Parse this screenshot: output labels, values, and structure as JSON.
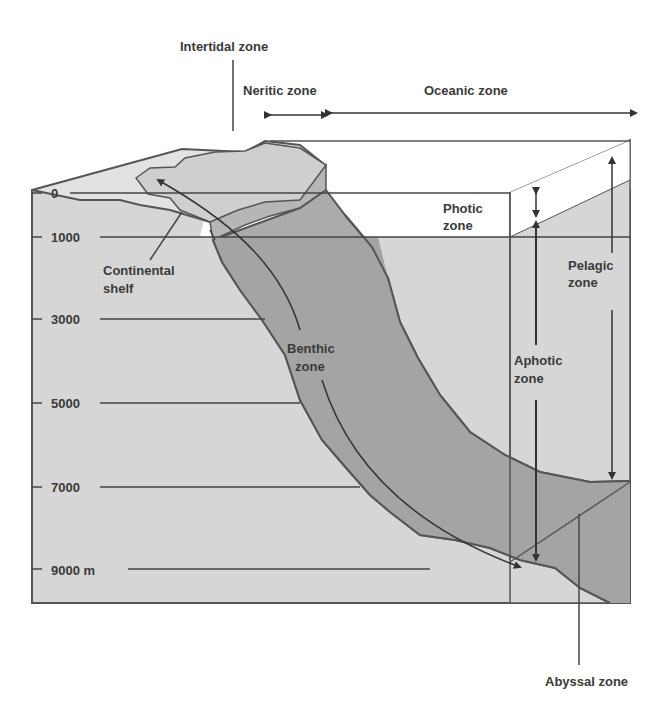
{
  "labels": {
    "intertidal": "Intertidal zone",
    "neritic": "Neritic zone",
    "oceanic": "Oceanic zone",
    "photic_1": "Photic",
    "photic_2": "zone",
    "pelagic_1": "Pelagic",
    "pelagic_2": "zone",
    "aphotic_1": "Aphotic",
    "aphotic_2": "zone",
    "continental_1": "Continental",
    "continental_2": "shelf",
    "benthic_1": "Benthic",
    "benthic_2": "zone",
    "abyssal": "Abyssal zone"
  },
  "depth_scale": {
    "ticks": [
      "0",
      "1000",
      "3000",
      "5000",
      "7000",
      "9000 m"
    ]
  },
  "colors": {
    "water_light": "#d6d6d6",
    "water_photic": "#ffffff",
    "slope_dark": "#a9a9a9",
    "shelf_top": "#e2e2e2",
    "line": "#555555",
    "text": "#3a3a3a"
  }
}
